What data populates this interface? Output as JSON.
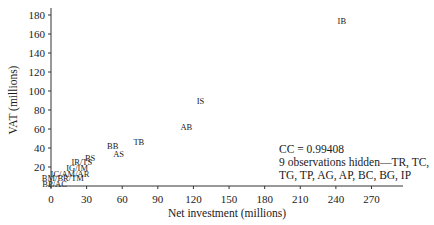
{
  "chart_data": {
    "type": "scatter",
    "title": "",
    "xlabel": "Net investment (millions)",
    "ylabel": "VAT (millions)",
    "xlim": [
      0,
      290
    ],
    "ylim": [
      0,
      185
    ],
    "xticks": [
      0,
      30,
      60,
      90,
      120,
      150,
      180,
      210,
      240,
      270
    ],
    "yticks": [
      20,
      40,
      60,
      80,
      100,
      120,
      140,
      160,
      180
    ],
    "grid": false,
    "marker_style": "text-labels",
    "points": [
      {
        "label": "IB",
        "x": 245,
        "y": 174
      },
      {
        "label": "IS",
        "x": 126,
        "y": 90
      },
      {
        "label": "AB",
        "x": 114,
        "y": 62
      },
      {
        "label": "TB",
        "x": 74,
        "y": 46
      },
      {
        "label": "BB",
        "x": 52,
        "y": 42
      },
      {
        "label": "AS",
        "x": 57,
        "y": 34
      },
      {
        "label": "BS",
        "x": 33,
        "y": 30
      },
      {
        "label": "IR/TS",
        "x": 26,
        "y": 25
      },
      {
        "label": "IG/IM",
        "x": 22,
        "y": 19
      },
      {
        "label": "IC/AM/AR",
        "x": 16,
        "y": 13
      },
      {
        "label": "BM/BR/TM",
        "x": 10,
        "y": 8
      },
      {
        "label": "BP/AC",
        "x": 3,
        "y": 2
      }
    ],
    "annotations": [
      "CC = 0.99408",
      "9 observations hidden—TR, TC,",
      "TG, TP, AG, AP, BC, BG, IP"
    ]
  }
}
